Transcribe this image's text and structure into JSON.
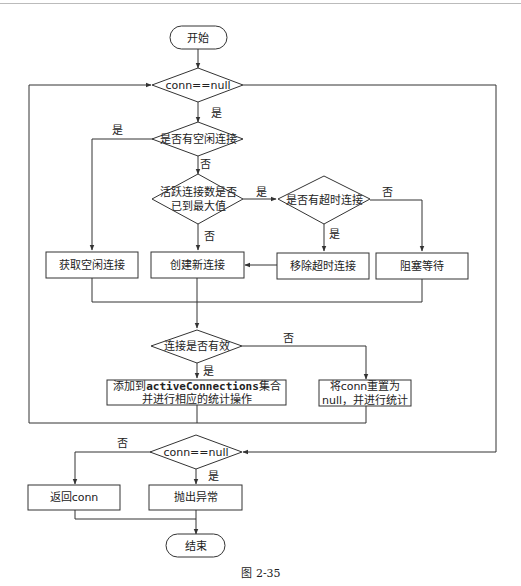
{
  "diagram": {
    "type": "flowchart",
    "nodes": {
      "start": "开始",
      "cond1": "conn==null",
      "idle_check": "是否有空闲连接",
      "max_check_line1": "活跃连接数是否",
      "max_check_line2": "已到最大值",
      "timeout_check": "是否有超时连接",
      "get_idle": "获取空闲连接",
      "create_new": "创建新连接",
      "remove_timeout": "移除超时连接",
      "block_wait": "阻塞等待",
      "valid_check": "连接是否有效",
      "add_active_prefix": "添加到",
      "add_active_code": "activeConnections",
      "add_active_suffix": "集合",
      "add_active_line2": "并进行相应的统计操作",
      "reset_prefix": "将",
      "reset_code": "conn",
      "reset_suffix": "重置为",
      "reset_line2": "null，并进行统计",
      "cond2": "conn==null",
      "return_conn": "返回conn",
      "throw_exc": "抛出异常",
      "end": "结束"
    },
    "edge_labels": {
      "cond1_yes": "是",
      "idle_yes": "是",
      "idle_no": "否",
      "max_yes": "是",
      "max_no": "否",
      "timeout_yes": "是",
      "timeout_no": "否",
      "valid_yes": "是",
      "valid_no": "否",
      "cond2_no": "否",
      "cond2_yes": "是"
    },
    "edges": [
      [
        "start",
        "cond1",
        ""
      ],
      [
        "cond1",
        "idle_check",
        "是"
      ],
      [
        "cond1",
        "cond2",
        "(else)"
      ],
      [
        "idle_check",
        "get_idle",
        "是"
      ],
      [
        "idle_check",
        "max_check",
        "否"
      ],
      [
        "max_check",
        "timeout_check",
        "是"
      ],
      [
        "max_check",
        "create_new",
        "否"
      ],
      [
        "timeout_check",
        "remove_timeout",
        "是"
      ],
      [
        "timeout_check",
        "block_wait",
        "否"
      ],
      [
        "remove_timeout",
        "create_new",
        ""
      ],
      [
        "get_idle",
        "valid_check",
        ""
      ],
      [
        "create_new",
        "valid_check",
        ""
      ],
      [
        "block_wait",
        "valid_check",
        ""
      ],
      [
        "valid_check",
        "add_active",
        "是"
      ],
      [
        "valid_check",
        "reset_conn",
        "否"
      ],
      [
        "add_active",
        "cond1",
        "loop"
      ],
      [
        "reset_conn",
        "cond1",
        "loop"
      ],
      [
        "cond2",
        "return_conn",
        "否"
      ],
      [
        "cond2",
        "throw_exc",
        "是"
      ],
      [
        "return_conn",
        "end",
        ""
      ],
      [
        "throw_exc",
        "end",
        ""
      ]
    ],
    "caption": "图 2-35"
  }
}
